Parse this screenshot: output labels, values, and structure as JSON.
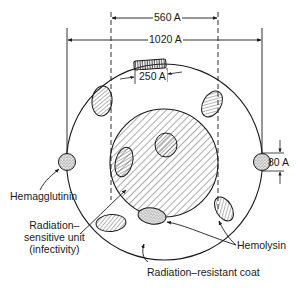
{
  "figure": {
    "dimensions": {
      "inner_diameter": "560 A",
      "outer_diameter": "1020 A",
      "hemolysin_length": "250 A",
      "hemagglutinin_size": "80 A"
    },
    "labels": {
      "hemagglutinin": "Hemagglutinin",
      "radiation_sensitive_line1": "Radiation–",
      "radiation_sensitive_line2": "sensitive unit",
      "radiation_sensitive_line3": "(infectivity)",
      "hemolysin": "Hemolysin",
      "coat": "Radiation–resistant coat"
    },
    "colors": {
      "stroke": "#1a1a1a",
      "hatch": "#444444",
      "background": "#ffffff"
    }
  }
}
